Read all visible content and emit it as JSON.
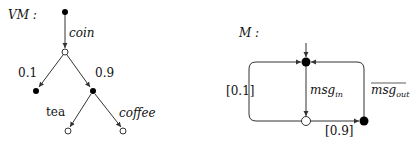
{
  "diagrams": [
    {
      "title": "VM :",
      "type": "probabilistic-tree",
      "nodes": [
        {
          "id": "root",
          "kind": "filled"
        },
        {
          "id": "choice",
          "kind": "open"
        },
        {
          "id": "left-leaf",
          "kind": "filled"
        },
        {
          "id": "right",
          "kind": "filled"
        },
        {
          "id": "tea-leaf",
          "kind": "open"
        },
        {
          "id": "coffee-leaf",
          "kind": "open"
        }
      ],
      "edges": [
        {
          "from": "root",
          "to": "choice",
          "label": "coin"
        },
        {
          "from": "choice",
          "to": "left-leaf",
          "label": "0.1"
        },
        {
          "from": "choice",
          "to": "right",
          "label": "0.9"
        },
        {
          "from": "right",
          "to": "tea-leaf",
          "label": "tea"
        },
        {
          "from": "right",
          "to": "coffee-leaf",
          "label": "coffee"
        }
      ]
    },
    {
      "title": "M :",
      "type": "probabilistic-automaton",
      "nodes": [
        {
          "id": "top",
          "kind": "filled",
          "initial": true
        },
        {
          "id": "bottom",
          "kind": "open"
        },
        {
          "id": "right",
          "kind": "filled"
        }
      ],
      "edges": [
        {
          "from": "top",
          "to": "bottom",
          "label_base": "msg",
          "label_sub": "in"
        },
        {
          "from": "bottom",
          "to": "top",
          "label": "[0.1]"
        },
        {
          "from": "bottom",
          "to": "right",
          "label": "[0.9]"
        },
        {
          "from": "right",
          "to": "top",
          "label_base": "msg",
          "label_sub": "out",
          "overlined": true
        }
      ]
    }
  ]
}
